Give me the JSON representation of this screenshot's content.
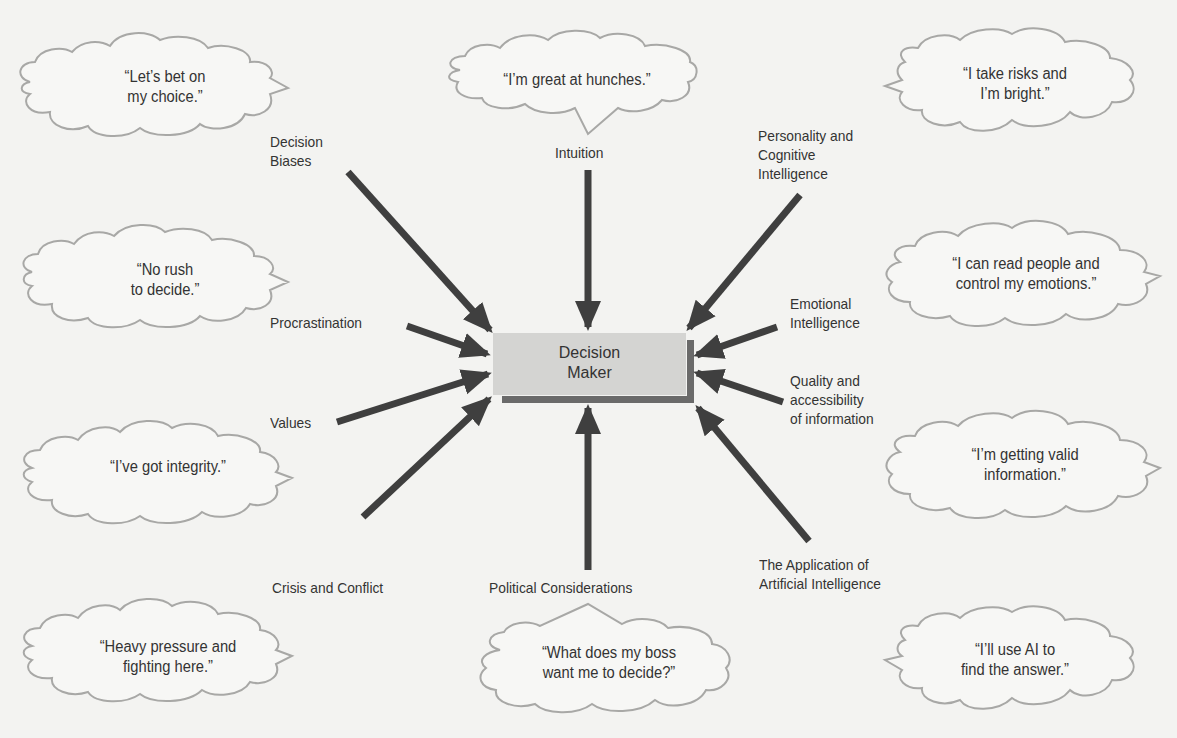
{
  "diagram": {
    "center": {
      "line1": "Decision",
      "line2": "Maker"
    },
    "factors": [
      {
        "id": "decision-biases",
        "lines": [
          "Decision",
          "Biases"
        ]
      },
      {
        "id": "intuition",
        "lines": [
          "Intuition"
        ]
      },
      {
        "id": "personality",
        "lines": [
          "Personality and",
          "Cognitive",
          "Intelligence"
        ]
      },
      {
        "id": "procrastination",
        "lines": [
          "Procrastination"
        ]
      },
      {
        "id": "emotional",
        "lines": [
          "Emotional",
          "Intelligence"
        ]
      },
      {
        "id": "values",
        "lines": [
          "Values"
        ]
      },
      {
        "id": "quality",
        "lines": [
          "Quality and",
          "accessibility",
          "of information"
        ]
      },
      {
        "id": "crisis",
        "lines": [
          "Crisis and Conflict"
        ]
      },
      {
        "id": "political",
        "lines": [
          "Political Considerations"
        ]
      },
      {
        "id": "ai",
        "lines": [
          "The Application of",
          "Artificial Intelligence"
        ]
      }
    ],
    "thoughts": [
      {
        "id": "bet",
        "lines": [
          "“Let’s bet on",
          "my choice.”"
        ]
      },
      {
        "id": "hunches",
        "lines": [
          "“I’m great at hunches.”"
        ]
      },
      {
        "id": "risks",
        "lines": [
          "“I take risks and",
          "I’m bright.”"
        ]
      },
      {
        "id": "no-rush",
        "lines": [
          "“No rush",
          "to decide.”"
        ]
      },
      {
        "id": "read-people",
        "lines": [
          "“I can read people and",
          "control my emotions.”"
        ]
      },
      {
        "id": "integrity",
        "lines": [
          "“I’ve got integrity.”"
        ]
      },
      {
        "id": "valid-info",
        "lines": [
          "“I’m getting valid",
          "information.”"
        ]
      },
      {
        "id": "pressure",
        "lines": [
          "“Heavy pressure and",
          "fighting here.”"
        ]
      },
      {
        "id": "boss",
        "lines": [
          "“What does my boss",
          "want me to decide?”"
        ]
      },
      {
        "id": "use-ai",
        "lines": [
          "“I’ll use AI to",
          "find the answer.”"
        ]
      }
    ],
    "colors": {
      "background": "#f3f3f1",
      "arrow": "#3f3f3f",
      "box_fill": "#d4d4d2",
      "box_shadow": "#6a6a6a",
      "cloud_stroke": "#a8a8a6",
      "cloud_fill": "#f7f7f5",
      "text": "#333333"
    }
  }
}
